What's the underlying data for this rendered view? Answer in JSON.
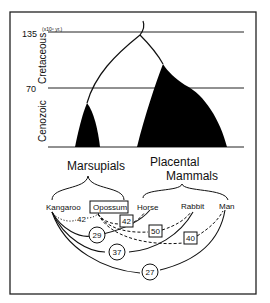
{
  "axis": {
    "unit": "(x10⁶ yr.)",
    "ticks": [
      {
        "label": "135",
        "value": 135
      },
      {
        "label": "70",
        "value": 70
      }
    ],
    "eras": [
      "Cretaceous",
      "Cenozoic"
    ]
  },
  "groups": {
    "marsupials": "Marsupials",
    "placental_line1": "Placental",
    "placental_line2": "Mammals"
  },
  "species": [
    "Kangaroo",
    "Opossum",
    "Horse",
    "Rabbit",
    "Man"
  ],
  "distances": [
    {
      "from": "Kangaroo",
      "to": "Opossum",
      "value": "42",
      "style": "dotted"
    },
    {
      "from": "Opossum",
      "to": "Horse",
      "value": "42",
      "style": "dashed-box"
    },
    {
      "from": "Kangaroo",
      "to": "Horse",
      "value": "29",
      "style": "solid-circle"
    },
    {
      "from": "Opossum",
      "to": "Rabbit",
      "value": "50",
      "style": "dashed-box"
    },
    {
      "from": "Kangaroo",
      "to": "Rabbit",
      "value": "37",
      "style": "solid-circle"
    },
    {
      "from": "Opossum",
      "to": "Man",
      "value": "40",
      "style": "dashed-box"
    },
    {
      "from": "Kangaroo",
      "to": "Man",
      "value": "27",
      "style": "solid-circle"
    }
  ]
}
